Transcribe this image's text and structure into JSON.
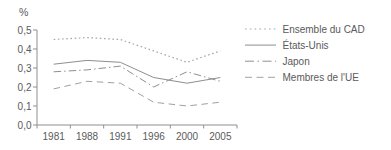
{
  "chart_data": {
    "type": "line",
    "title": "",
    "ylabel": "%",
    "xlabel": "",
    "categories": [
      "1981",
      "1988",
      "1991",
      "1996",
      "2000",
      "2005"
    ],
    "series": [
      {
        "name": "Ensemble du CAD",
        "style": "dotted",
        "color": "#a6a6a6",
        "values": [
          0.45,
          0.46,
          0.45,
          0.39,
          0.33,
          0.39
        ]
      },
      {
        "name": "États-Unis",
        "style": "solid",
        "color": "#8e8e8e",
        "values": [
          0.32,
          0.34,
          0.33,
          0.25,
          0.22,
          0.25
        ]
      },
      {
        "name": "Japon",
        "style": "dashdot",
        "color": "#909090",
        "values": [
          0.28,
          0.29,
          0.31,
          0.2,
          0.28,
          0.23
        ]
      },
      {
        "name": "Membres de l'UE",
        "style": "dashed",
        "color": "#a0a0a0",
        "values": [
          0.19,
          0.23,
          0.22,
          0.12,
          0.1,
          0.12
        ]
      }
    ],
    "ylim": [
      0.0,
      0.5
    ],
    "yticks": [
      {
        "value": 0.5,
        "label": "0,5"
      },
      {
        "value": 0.4,
        "label": "0,4"
      },
      {
        "value": 0.3,
        "label": "0,3"
      },
      {
        "value": 0.2,
        "label": "0,2"
      },
      {
        "value": 0.1,
        "label": "0,1"
      },
      {
        "value": 0.0,
        "label": "0,0"
      }
    ],
    "grid": false,
    "legend_position": "right",
    "colors": {
      "axis": "#8f8f8f",
      "text": "#5a5a5a",
      "background": "#ffffff"
    }
  }
}
